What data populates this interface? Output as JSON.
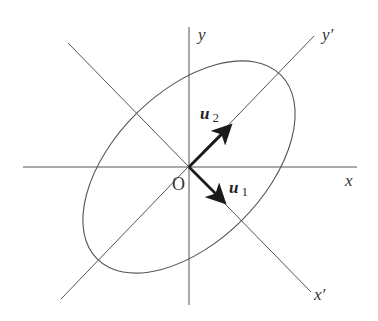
{
  "diagram": {
    "origin_label": "O",
    "axes": {
      "x": "x",
      "y": "y",
      "x_prime": "x′",
      "y_prime": "y′"
    },
    "vectors": {
      "u1": {
        "base": "u",
        "sub": "1"
      },
      "u2": {
        "base": "u",
        "sub": "2"
      }
    },
    "ellipse": {
      "rotation_deg": -45,
      "semi_major": 130,
      "semi_minor": 75
    },
    "colors": {
      "lines": "#555555",
      "vectors": "#1a1a1a"
    }
  }
}
